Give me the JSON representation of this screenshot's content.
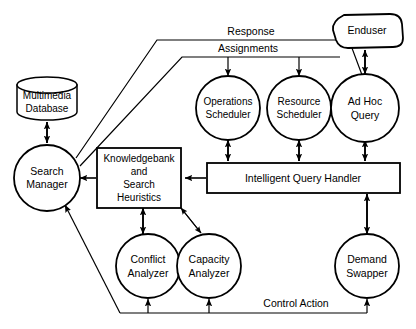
{
  "diagram": {
    "background_color": "#ffffff",
    "stroke_color": "#000000",
    "nodes": [
      {
        "id": "multimedia_database",
        "label_line1": "Multimedia",
        "label_line2": "Database",
        "shape": "cylinder"
      },
      {
        "id": "search_manager",
        "label_line1": "Search",
        "label_line2": "Manager",
        "shape": "circle"
      },
      {
        "id": "knowledgebank",
        "label_line1": "Knowledgebank",
        "label_line2": "and",
        "label_line3": "Search",
        "label_line4": "Heuristics",
        "shape": "rectangle"
      },
      {
        "id": "operations_scheduler",
        "label_line1": "Operations",
        "label_line2": "Scheduler",
        "shape": "circle"
      },
      {
        "id": "resource_scheduler",
        "label_line1": "Resource",
        "label_line2": "Scheduler",
        "shape": "circle"
      },
      {
        "id": "ad_hoc_query",
        "label_line1": "Ad Hoc",
        "label_line2": "Query",
        "shape": "circle"
      },
      {
        "id": "enduser",
        "label_line1": "Enduser",
        "shape": "rounded-blob"
      },
      {
        "id": "intelligent_query_handler",
        "label_line1": "Intelligent Query Handler",
        "shape": "rectangle"
      },
      {
        "id": "conflict_analyzer",
        "label_line1": "Conflict",
        "label_line2": "Analyzer",
        "shape": "circle"
      },
      {
        "id": "capacity_analyzer",
        "label_line1": "Capacity",
        "label_line2": "Analyzer",
        "shape": "circle"
      },
      {
        "id": "demand_swapper",
        "label_line1": "Demand",
        "label_line2": "Swapper",
        "shape": "circle"
      }
    ],
    "edge_labels": [
      {
        "id": "response",
        "text": "Response"
      },
      {
        "id": "assignments",
        "text": "Assignments"
      },
      {
        "id": "control_action",
        "text": "Control Action"
      }
    ]
  }
}
